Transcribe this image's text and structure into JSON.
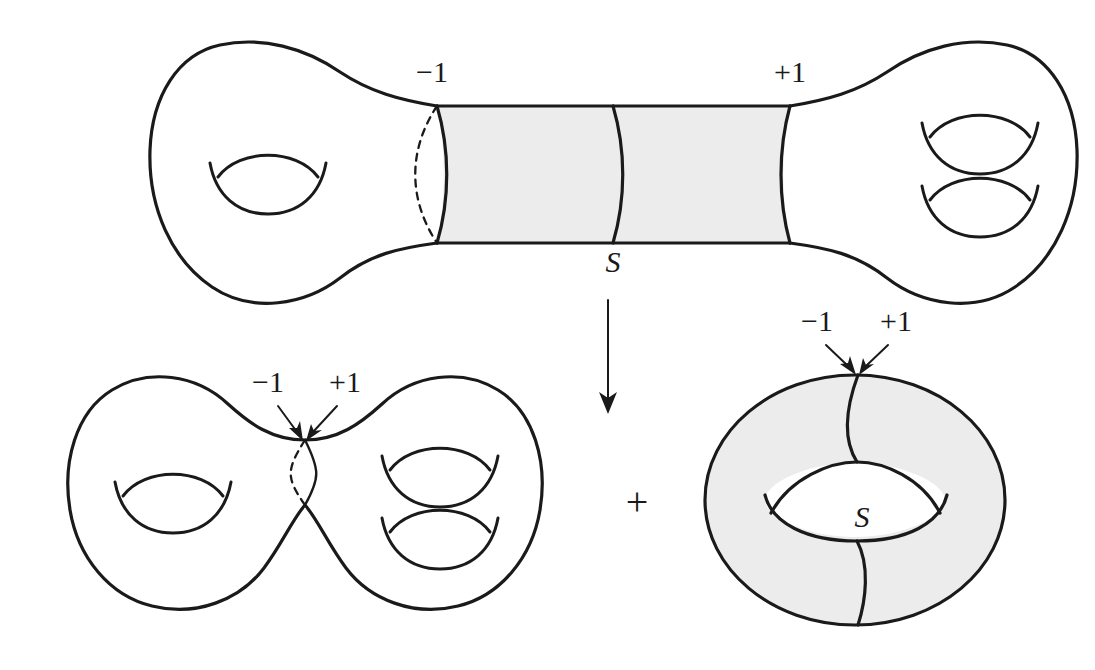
{
  "canvas": {
    "width": 1095,
    "height": 670,
    "background": "#ffffff",
    "ink_color": "#1a1a1a",
    "shade_color": "#ececec"
  },
  "diagram": {
    "kind": "topology-surface-decomposition"
  },
  "top_figure": {
    "name": "genus-3 dumbbell surface with shaded cylinder",
    "label_minus_one": "−1",
    "label_plus_one": "+1",
    "label_s": "S",
    "left_handles": 1,
    "right_handles": 2,
    "shaded": true
  },
  "transform_arrow": {
    "name": "downward transformation arrow",
    "direction": "down"
  },
  "bottom_left_figure": {
    "name": "pinched genus-3 surface",
    "label_minus_one": "−1",
    "label_plus_one": "+1",
    "left_handles": 1,
    "right_handles": 2,
    "shaded": false
  },
  "operator": {
    "plus": "+"
  },
  "bottom_right_figure": {
    "name": "shaded torus",
    "label_minus_one": "−1",
    "label_plus_one": "+1",
    "label_s": "S",
    "shaded": true
  }
}
